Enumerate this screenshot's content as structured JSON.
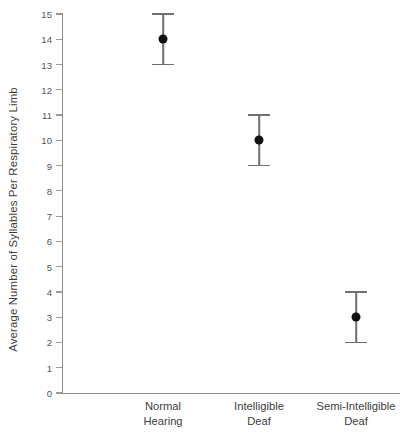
{
  "chart_data": {
    "type": "scatter",
    "title": "",
    "subtitle": "",
    "xlabel": "",
    "ylabel": "Average Number of Syllables Per Respiratory Limb",
    "ylim": [
      0,
      15
    ],
    "ytick_step": 1,
    "ytick_labels": [
      "15",
      "14",
      "13",
      "12",
      "11",
      "10",
      "9",
      "8",
      "7",
      "6",
      "5",
      "4",
      "3",
      "2",
      "1",
      "0"
    ],
    "grid": false,
    "legend": null,
    "error_bar_style": "capped-vertical",
    "categories": [
      "Normal Hearing",
      "Intelligible Deaf",
      "Semi-Intelligible Deaf"
    ],
    "category_lines": [
      [
        "Normal",
        "Hearing"
      ],
      [
        "Intelligible",
        "Deaf"
      ],
      [
        "Semi-Intelligible",
        "Deaf"
      ]
    ],
    "values": [
      14,
      10,
      3
    ],
    "error_low": [
      13,
      9,
      2
    ],
    "error_high": [
      15,
      11,
      4
    ],
    "points": [
      {
        "category": "Normal Hearing",
        "mean": 14,
        "low": 13,
        "high": 15
      },
      {
        "category": "Intelligible Deaf",
        "mean": 10,
        "low": 9,
        "high": 11
      },
      {
        "category": "Semi-Intelligible Deaf",
        "mean": 3,
        "low": 2,
        "high": 4
      }
    ],
    "colors": {
      "background": "#ffffff",
      "axis": "#8d8d8d",
      "marker": "#111111",
      "errorbar": "#6f6f6f",
      "text": "#3d3d3d"
    }
  }
}
